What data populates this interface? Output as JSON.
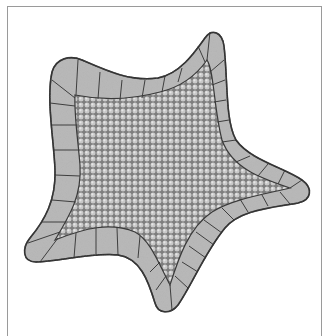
{
  "figure": {
    "colors": {
      "background": "#ffffff",
      "frame": "#9a9a9a",
      "tile_fill": "#b9b9b9",
      "tile_stroke": "#4a4a4a",
      "granule_fill": "#d0d0d0",
      "granule_bg": "#7a7a7a"
    }
  }
}
